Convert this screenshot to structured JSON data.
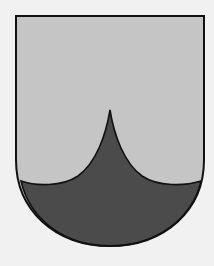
{
  "image": {
    "subject": "heraldic shield (coat of arms)",
    "width": 214,
    "height": 266
  },
  "colors": {
    "background": "#f1f1f1",
    "chief_field": "#c5c5c5",
    "base_field": "#4b4b4b",
    "outline": "#111111"
  },
  "shield": {
    "shape": "round-bottomed (Iberian) shield",
    "division": "base with a single upward-pointing ogival peak",
    "tincture_upper": "light grey (argent)",
    "tincture_lower": "dark grey (sable)"
  }
}
